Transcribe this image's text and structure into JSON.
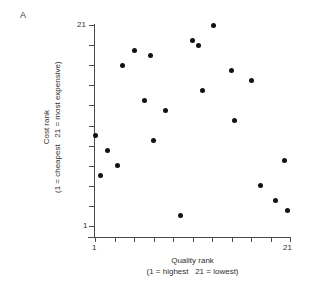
{
  "panel": {
    "label": "A"
  },
  "axes": {
    "x": {
      "title": "Quality rank",
      "subtitle": "(1 = highest   21 = lowest)",
      "tick_min_label": "1",
      "tick_max_label": "21",
      "min": 1,
      "max": 21,
      "tick_count": 11
    },
    "y": {
      "title": "Cost rank",
      "subtitle": "(1 = cheapest   21 = most expensive)",
      "tick_min_label": "1",
      "tick_max_label": "21",
      "min": 1,
      "max": 21,
      "tick_count": 11
    }
  },
  "style": {
    "marker_color": "#121212",
    "axis_color": "#4a4a4a",
    "background": "#ffffff"
  },
  "chart_data": {
    "type": "scatter",
    "title": "",
    "xlabel": "Quality rank (1 = highest   21 = lowest)",
    "ylabel": "Cost rank (1 = cheapest   21 = most expensive)",
    "xlim": [
      1,
      21
    ],
    "ylim": [
      1,
      21
    ],
    "grid": false,
    "legend": false,
    "series": [
      {
        "name": "Wines",
        "points": [
          {
            "x": 1.0,
            "y": 10.0
          },
          {
            "x": 1.6,
            "y": 6.0
          },
          {
            "x": 2.3,
            "y": 8.5
          },
          {
            "x": 3.3,
            "y": 7.0
          },
          {
            "x": 3.8,
            "y": 17.0
          },
          {
            "x": 5.0,
            "y": 18.5
          },
          {
            "x": 6.1,
            "y": 13.5
          },
          {
            "x": 6.7,
            "y": 18.0
          },
          {
            "x": 7.0,
            "y": 9.5
          },
          {
            "x": 8.2,
            "y": 12.5
          },
          {
            "x": 9.8,
            "y": 2.0
          },
          {
            "x": 11.0,
            "y": 19.5
          },
          {
            "x": 11.6,
            "y": 19.0
          },
          {
            "x": 12.0,
            "y": 14.5
          },
          {
            "x": 13.2,
            "y": 21.0
          },
          {
            "x": 15.0,
            "y": 16.5
          },
          {
            "x": 15.3,
            "y": 11.5
          },
          {
            "x": 17.1,
            "y": 15.5
          },
          {
            "x": 18.0,
            "y": 5.0
          },
          {
            "x": 19.5,
            "y": 3.5
          },
          {
            "x": 20.4,
            "y": 7.5
          },
          {
            "x": 20.7,
            "y": 2.5
          }
        ]
      }
    ]
  }
}
